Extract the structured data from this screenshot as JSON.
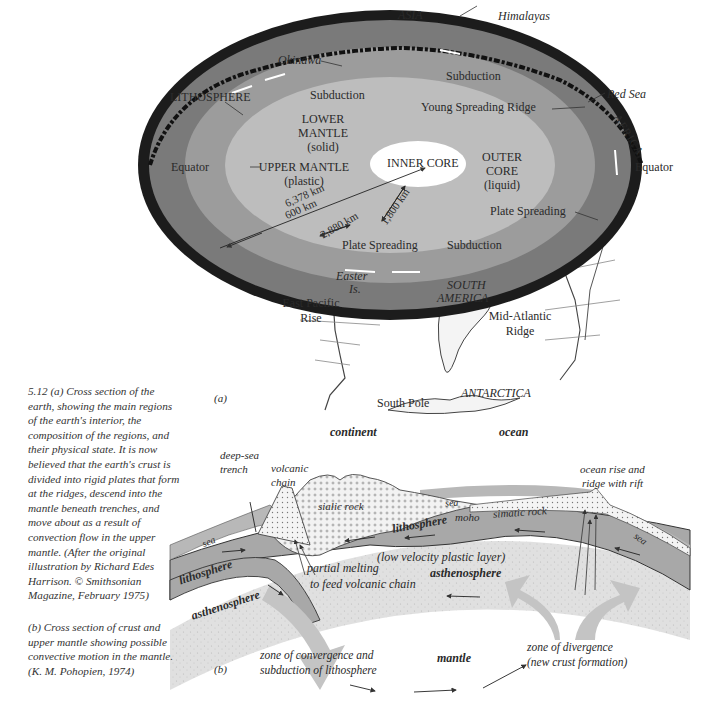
{
  "figure_number": "5.12",
  "panel_a": {
    "panel_label": "(a)",
    "labels": {
      "asia": "ASIA",
      "himalayas": "Himalayas",
      "okinawa": "Okinawa",
      "lithosphere": "LITHOSPHERE",
      "subduction_top_right": "Subduction",
      "subduction_top_left": "Subduction",
      "red_sea": "Red Sea",
      "young_spreading_ridge": "Young Spreading Ridge",
      "africa": "AFRICA",
      "lower_mantle_1": "LOWER",
      "lower_mantle_2": "MANTLE",
      "lower_mantle_3": "(solid)",
      "equator_left": "Equator",
      "equator_right": "Equator",
      "upper_mantle_1": "UPPER MANTLE",
      "upper_mantle_2": "(plastic)",
      "inner_core": "INNER CORE",
      "outer_core_1": "OUTER",
      "outer_core_2": "CORE",
      "outer_core_3": "(liquid)",
      "dist_600": "600 km",
      "dist_6378": "6,378 km",
      "dist_2880": "2,880 km",
      "dist_1800": "1,800 km",
      "plate_spreading_right": "Plate Spreading",
      "plate_spreading_bottom": "Plate Spreading",
      "subduction_bottom": "Subduction",
      "easter_1": "Easter",
      "easter_2": "Is.",
      "east_pacific_1": "East Pacific",
      "east_pacific_2": "Rise",
      "south_america_1": "SOUTH",
      "south_america_2": "AMERICA",
      "mid_atlantic_1": "Mid-Atlantic",
      "mid_atlantic_2": "Ridge",
      "antarctica": "ANTARCTICA",
      "south_pole": "South Pole"
    }
  },
  "panel_b": {
    "panel_label": "(b)",
    "labels": {
      "continent": "continent",
      "ocean": "ocean",
      "deep_sea_1": "deep-sea",
      "deep_sea_2": "trench",
      "volcanic_1": "volcanic",
      "volcanic_2": "chain",
      "ocean_rise_1": "ocean rise and",
      "ocean_rise_2": "ridge with rift",
      "sialic_rock": "sialic rock",
      "sea_left": "sea",
      "sea_mid": "sea",
      "sea_right": "sea",
      "moho": "moho",
      "simatic_rock": "simatic rock",
      "lithosphere_left": "lithosphere",
      "lithosphere_mid": "lithosphere",
      "low_velocity": "(low velocity plastic layer)",
      "asthenosphere_right": "asthenosphere",
      "asthenosphere_left": "asthenosphere",
      "partial_melting_1": "partial melting",
      "partial_melting_2": "to feed volcanic chain",
      "convergence_1": "zone of convergence and",
      "convergence_2": "subduction of lithosphere",
      "mantle": "mantle",
      "divergence_1": "zone of divergence",
      "divergence_2": "(new crust formation)"
    }
  },
  "caption": {
    "a_lines": [
      "5.12   (a) Cross section of the",
      "earth, showing the main regions",
      "of the earth's interior, the",
      "composition of the regions, and",
      "their physical state. It is now",
      "believed that the earth's crust is",
      "divided into rigid plates that form",
      "at the ridges, descend into the",
      "mantle beneath trenches, and",
      "move about as a result of",
      "convection flow in the upper",
      "mantle. (After the original",
      "illustration by Richard Edes",
      "Harrison. © Smithsonian",
      "Magazine, February 1975)"
    ],
    "b_lines": [
      "(b) Cross section of crust and",
      "upper mantle showing possible",
      "convective motion in the mantle.",
      "(K. M. Pohopien, 1974)"
    ]
  },
  "colors": {
    "crust": "#1c1c1c",
    "upper_mantle": "#7a7a7a",
    "lower_mantle": "#9c9c9c",
    "outer_core": "#bdbdbd",
    "inner_core": "#ffffff",
    "globe_surface": "#ececec",
    "lithosphere_band": "#a8a8a8",
    "asthenosphere_band": "#dcdcdc",
    "flow_arrows": "#c4c4c4"
  }
}
